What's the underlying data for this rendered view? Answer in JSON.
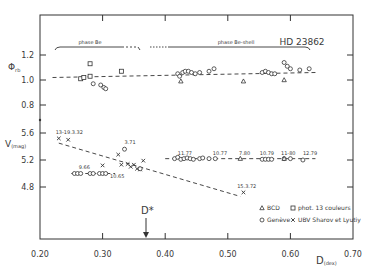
{
  "chart_data": {
    "type": "scatter",
    "title": "HD 23862",
    "xlabel": "D (dex)",
    "x_label_main": "D",
    "x_label_sub": "(dex)",
    "xlim": [
      0.2,
      0.7
    ],
    "x_ticks": [
      "0.20",
      "0.30",
      "0.40",
      "0.50",
      "0.60",
      "0.70"
    ],
    "grid": false,
    "panels": [
      {
        "name": "upper",
        "ylabel": "Φrb",
        "ylabel_main": "Φ",
        "ylabel_sub": "rb",
        "y_ticks": [
          "1.2",
          "1.0",
          "0.8"
        ],
        "ylim": [
          0.8,
          1.2
        ],
        "phase_labels": [
          "phase Be",
          "phase Be-shell"
        ],
        "trend": {
          "x": [
            0.22,
            0.64
          ],
          "y": [
            1.02,
            1.06
          ]
        },
        "series": [
          {
            "name": "phot. 13 couleurs",
            "marker": "square",
            "x": [
              0.265,
              0.27,
              0.28,
              0.28,
              0.33
            ],
            "y": [
              1.01,
              1.02,
              1.13,
              1.03,
              1.07
            ]
          },
          {
            "name": "Genève",
            "marker": "circle",
            "x": [
              0.285,
              0.297,
              0.302,
              0.305,
              0.42,
              0.423,
              0.428,
              0.432,
              0.437,
              0.442,
              0.448,
              0.455,
              0.47,
              0.478,
              0.555,
              0.56,
              0.565,
              0.57,
              0.575,
              0.59,
              0.595,
              0.6,
              0.615,
              0.63
            ],
            "y": [
              0.97,
              0.96,
              0.94,
              0.93,
              1.05,
              1.03,
              1.06,
              1.07,
              1.07,
              1.06,
              1.05,
              1.06,
              1.07,
              1.09,
              1.06,
              1.07,
              1.06,
              1.05,
              1.05,
              1.14,
              1.11,
              1.09,
              1.08,
              1.09
            ]
          },
          {
            "name": "BCD",
            "marker": "triangle",
            "x": [
              0.425,
              0.525,
              0.59
            ],
            "y": [
              0.99,
              0.99,
              1.0
            ]
          }
        ]
      },
      {
        "name": "lower",
        "ylabel": "V(mag)",
        "ylabel_main": "V",
        "ylabel_sub": "(mag)",
        "y_ticks": [
          "5.6",
          "5.2",
          "4.8"
        ],
        "ylim": [
          4.6,
          5.7
        ],
        "trends": [
          {
            "x": [
              0.23,
              0.52
            ],
            "y": [
              5.45,
              4.66
            ]
          },
          {
            "x": [
              0.25,
              0.32
            ],
            "y": [
              5.0,
              5.0
            ]
          },
          {
            "x": [
              0.4,
              0.64
            ],
            "y": [
              5.22,
              5.22
            ]
          }
        ],
        "series": [
          {
            "name": "UBV Sharov et Lyutiy",
            "marker": "x",
            "x": [
              0.23,
              0.245,
              0.3,
              0.325,
              0.33,
              0.34,
              0.345,
              0.35,
              0.355,
              0.36,
              0.365,
              0.525
            ],
            "y": [
              5.52,
              5.5,
              5.12,
              5.28,
              5.13,
              5.14,
              5.1,
              5.13,
              5.07,
              5.06,
              5.19,
              4.72
            ]
          },
          {
            "name": "Genève",
            "marker": "circle",
            "x": [
              0.255,
              0.26,
              0.265,
              0.28,
              0.285,
              0.295,
              0.3,
              0.305,
              0.335,
              0.36,
              0.415,
              0.42,
              0.425,
              0.43,
              0.435,
              0.44,
              0.445,
              0.455,
              0.46,
              0.47,
              0.48,
              0.555,
              0.56,
              0.565,
              0.57,
              0.59,
              0.6,
              0.62
            ],
            "y": [
              5.0,
              5.0,
              5.0,
              5.0,
              5.0,
              5.0,
              5.0,
              5.0,
              5.36,
              5.07,
              5.22,
              5.24,
              5.21,
              5.22,
              5.23,
              5.22,
              5.21,
              5.22,
              5.23,
              5.22,
              5.22,
              5.21,
              5.21,
              5.21,
              5.21,
              5.22,
              5.22,
              5.2
            ]
          },
          {
            "name": "BCD",
            "marker": "triangle",
            "x": [
              0.52,
              0.59
            ],
            "y": [
              5.22,
              5.22
            ]
          }
        ],
        "annotations": [
          {
            "text": "13-19.3.32",
            "x": 0.225,
            "y": 5.58
          },
          {
            "text": "3.71",
            "x": 0.335,
            "y": 5.43
          },
          {
            "text": "9.66",
            "x": 0.262,
            "y": 5.07
          },
          {
            "text": "10.65",
            "x": 0.312,
            "y": 4.94
          },
          {
            "text": "11.77",
            "x": 0.42,
            "y": 5.28
          },
          {
            "text": "10.77",
            "x": 0.476,
            "y": 5.28
          },
          {
            "text": "7.80",
            "x": 0.518,
            "y": 5.28
          },
          {
            "text": "10.79",
            "x": 0.551,
            "y": 5.28
          },
          {
            "text": "11-80",
            "x": 0.585,
            "y": 5.28
          },
          {
            "text": "12.79",
            "x": 0.62,
            "y": 5.28
          },
          {
            "text": "15.3.72",
            "x": 0.515,
            "y": 4.78
          }
        ]
      }
    ],
    "reference_line": {
      "label": "D*",
      "x": 0.365
    },
    "legend": {
      "position": "lower right",
      "entries": [
        {
          "marker": "triangle",
          "label": "BCD"
        },
        {
          "marker": "square",
          "label": "phot. 13 couleurs"
        },
        {
          "marker": "circle",
          "label": "Genève"
        },
        {
          "marker": "x",
          "label": "UBV  Sharov et Lyutiy"
        }
      ]
    }
  }
}
